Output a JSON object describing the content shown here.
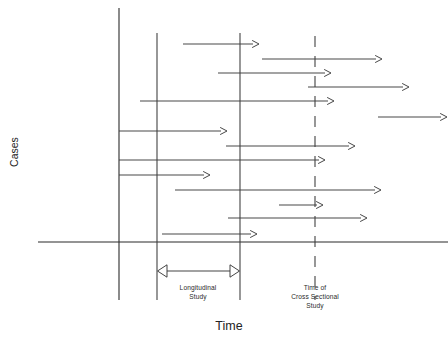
{
  "figure": {
    "axis_titles": {
      "x": "Time",
      "y": "Cases"
    },
    "annotations": {
      "longitudinal": {
        "line1": "Longitudinal",
        "line2": "Study"
      },
      "cross_sectional": {
        "line1": "Time of",
        "line2": "Cross Sectional",
        "line3": "Study"
      }
    },
    "caption": ""
  },
  "chart_data": {
    "type": "line",
    "title": "",
    "xlabel": "Time",
    "ylabel": "Cases",
    "grid": false,
    "legend": null,
    "axes": {
      "x_axis": {
        "y": 242,
        "x_start": 38,
        "x_end": 448
      },
      "y_axis": {
        "x": 119,
        "y_start": 8,
        "y_end": 300
      }
    },
    "reference_lines": [
      {
        "name": "longitudinal-study-start",
        "x": 157,
        "y_start": 33,
        "y_end": 300,
        "style": "solid"
      },
      {
        "name": "longitudinal-study-end",
        "x": 240,
        "y_start": 33,
        "y_end": 300,
        "style": "solid"
      },
      {
        "name": "cross-sectional-time",
        "x": 315,
        "y_start": 36,
        "y_end": 300,
        "style": "dashed"
      }
    ],
    "span_marker": {
      "name": "longitudinal-study-span",
      "y": 271,
      "x_start": 157,
      "x_end": 240,
      "double_headed": true
    },
    "cases": [
      {
        "id": 1,
        "y": 44,
        "x_start": 183,
        "x_end": 259
      },
      {
        "id": 2,
        "y": 59,
        "x_start": 262,
        "x_end": 382
      },
      {
        "id": 3,
        "y": 73,
        "x_start": 218,
        "x_end": 331
      },
      {
        "id": 4,
        "y": 87,
        "x_start": 308,
        "x_end": 409
      },
      {
        "id": 5,
        "y": 101,
        "x_start": 140,
        "x_end": 334
      },
      {
        "id": 6,
        "y": 117,
        "x_start": 378,
        "x_end": 447
      },
      {
        "id": 7,
        "y": 131,
        "x_start": 119,
        "x_end": 227
      },
      {
        "id": 8,
        "y": 146,
        "x_start": 226,
        "x_end": 355
      },
      {
        "id": 9,
        "y": 160,
        "x_start": 119,
        "x_end": 325
      },
      {
        "id": 10,
        "y": 175,
        "x_start": 119,
        "x_end": 210
      },
      {
        "id": 11,
        "y": 190,
        "x_start": 175,
        "x_end": 381
      },
      {
        "id": 12,
        "y": 205,
        "x_start": 279,
        "x_end": 323
      },
      {
        "id": 13,
        "y": 218,
        "x_start": 228,
        "x_end": 367
      },
      {
        "id": 14,
        "y": 234,
        "x_start": 162,
        "x_end": 257
      }
    ]
  }
}
